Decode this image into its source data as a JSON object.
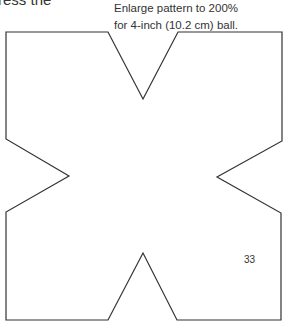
{
  "document": {
    "partial_heading": "ress the",
    "instruction": {
      "line1": "Enlarge pattern to 200%",
      "line2": "for 4-inch (10.2 cm) ball."
    },
    "page_number": "33",
    "pattern": {
      "shape": "x-shaped pattern outline",
      "stroke_color": "#333333",
      "points": "6,32 108,32 143,99 178,32 282,32 282,141 217,177 281,213 281,320 177,320 143,253 108,320 6,320 6,212 69,176 6,139"
    }
  }
}
